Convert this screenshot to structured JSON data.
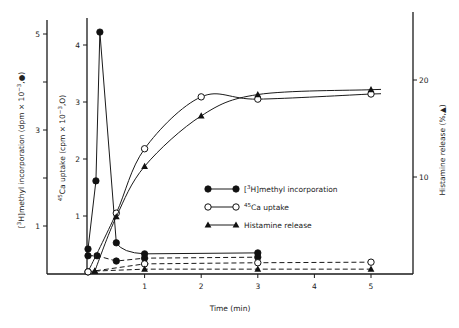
{
  "chart_data": {
    "type": "line",
    "title": "",
    "xlabel": "Time (min)",
    "x_ticks": [
      1,
      2,
      3,
      4,
      5
    ],
    "xlim": [
      0,
      5.5
    ],
    "axes": {
      "left_outer": {
        "label": "[3H]methyl incorporation (dpm × 10^-3, ●)",
        "label_parts": {
          "pre": "[",
          "sup": "3",
          "mid": "H]methyl incorporation (dpm × 10",
          "exp": "−3",
          "post": ",●)"
        },
        "ticks": [
          1,
          2,
          3,
          4,
          5
        ],
        "tick_labels": [
          "1",
          "",
          "3",
          "",
          "5"
        ],
        "ylim": [
          0,
          5.2
        ]
      },
      "left_inner": {
        "label": "45Ca uptake (cpm × 10^-3, ○)",
        "label_parts": {
          "sup": "45",
          "mid": "Ca uptake (cpm × 10",
          "exp": "−3",
          "post": ",O)"
        },
        "ticks": [
          1,
          2,
          3,
          4
        ],
        "tick_labels": [
          "1",
          "2",
          "3",
          "4"
        ],
        "ylim": [
          0,
          4.5
        ]
      },
      "right": {
        "label": "Histamine release (%,▲)",
        "ticks": [
          10,
          20
        ],
        "tick_labels": [
          "10",
          "20"
        ],
        "ylim": [
          0,
          26
        ]
      }
    },
    "series": [
      {
        "name": "[3H]methyl incorporation",
        "marker": "filled-circle",
        "line": "solid",
        "axis": "left_outer",
        "x": [
          0,
          0.14,
          0.21,
          0.5,
          1,
          3
        ],
        "values": [
          0.52,
          1.94,
          5.04,
          0.65,
          0.42,
          0.44
        ]
      },
      {
        "name": "[3H]methyl incorporation (control)",
        "marker": "filled-circle",
        "line": "dashed",
        "axis": "left_outer",
        "x": [
          0,
          0.16,
          0.5,
          1,
          3
        ],
        "values": [
          0.38,
          0.38,
          0.27,
          0.33,
          0.35
        ]
      },
      {
        "name": "45Ca uptake",
        "marker": "open-circle",
        "line": "solid",
        "axis": "left_inner",
        "x": [
          0,
          0.5,
          1,
          2,
          3,
          5
        ],
        "values": [
          0.02,
          1.05,
          2.18,
          3.09,
          3.05,
          3.14
        ]
      },
      {
        "name": "45Ca uptake (control)",
        "marker": "open-circle",
        "line": "dashed",
        "axis": "left_inner",
        "x": [
          0,
          1,
          3,
          5
        ],
        "values": [
          0.02,
          0.16,
          0.18,
          0.19
        ]
      },
      {
        "name": "Histamine release",
        "marker": "filled-triangle",
        "line": "solid",
        "axis": "right",
        "x": [
          0.12,
          0.5,
          1,
          2,
          3,
          5
        ],
        "values": [
          0.3,
          5.9,
          11.1,
          16.3,
          18.5,
          19.0
        ]
      },
      {
        "name": "Histamine release (control)",
        "marker": "filled-triangle",
        "line": "dashed",
        "axis": "right",
        "x": [
          0.12,
          1,
          3,
          5
        ],
        "values": [
          0.3,
          0.5,
          0.5,
          0.5
        ]
      }
    ],
    "legend": {
      "position": "center-right inside plot",
      "entries": [
        {
          "marker": "filled-circle",
          "sup": "3",
          "label": "[3H]methyl incorporation",
          "text_pre": "[",
          "text_post": "H]methyl incorporation"
        },
        {
          "marker": "open-circle",
          "sup": "45",
          "label": "45Ca uptake",
          "text_post": "Ca uptake"
        },
        {
          "marker": "filled-triangle",
          "sup": "",
          "label": "Histamine release",
          "text_post": "Histamine release"
        }
      ]
    },
    "grid": false
  }
}
